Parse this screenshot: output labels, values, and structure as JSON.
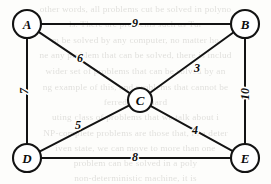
{
  "chart_data": {
    "type": "diagram",
    "diagram_kind": "weighted-undirected-graph",
    "title": "",
    "nodes": [
      {
        "id": "A",
        "label": "A",
        "x": 27,
        "y": 24,
        "r": 14
      },
      {
        "id": "B",
        "label": "B",
        "x": 245,
        "y": 24,
        "r": 14
      },
      {
        "id": "C",
        "label": "C",
        "x": 140,
        "y": 100,
        "r": 12
      },
      {
        "id": "D",
        "label": "D",
        "x": 27,
        "y": 158,
        "r": 14
      },
      {
        "id": "E",
        "label": "E",
        "x": 245,
        "y": 158,
        "r": 14
      }
    ],
    "edges": [
      {
        "from": "A",
        "to": "B",
        "weight": "9",
        "label_x": 135,
        "label_y": 23,
        "rotation": 0
      },
      {
        "from": "A",
        "to": "C",
        "weight": "6",
        "label_x": 80,
        "label_y": 58,
        "rotation": 0
      },
      {
        "from": "A",
        "to": "D",
        "weight": "7",
        "label_x": 24,
        "label_y": 91,
        "rotation": -90
      },
      {
        "from": "C",
        "to": "B",
        "weight": "3",
        "label_x": 197,
        "label_y": 68,
        "rotation": 0
      },
      {
        "from": "D",
        "to": "C",
        "weight": "5",
        "label_x": 78,
        "label_y": 125,
        "rotation": 0
      },
      {
        "from": "C",
        "to": "E",
        "weight": "4",
        "label_x": 195,
        "label_y": 130,
        "rotation": 0
      },
      {
        "from": "B",
        "to": "E",
        "weight": "10",
        "label_x": 245,
        "label_y": 94,
        "rotation": -90
      },
      {
        "from": "D",
        "to": "E",
        "weight": "8",
        "label_x": 135,
        "label_y": 157,
        "rotation": 0
      }
    ],
    "colors": {
      "stroke": "#131313",
      "node_fill": "#ffffff",
      "background": "#fdfdfb",
      "ghost_text": "#6d6a62"
    }
  },
  "background_bleed_text": {
    "note": "faint show-through text from the reverse side of the scanned page",
    "lines": [
      {
        "text": "other words, all problems cut be solved in polyno",
        "y": 2
      },
      {
        "text": "ls. There are problems such as Tur",
        "y": 17
      },
      {
        "text": "m be solved by any computer, no matter ho",
        "y": 33
      },
      {
        "text": "ne any problem that can be solved, there is includ",
        "y": 48
      },
      {
        "text": "wider set of problems that can be solved by an",
        "y": 64
      },
      {
        "text": "ng example of this, and problems that cannot be",
        "y": 80
      },
      {
        "text": "ferred to as hard",
        "y": 95
      },
      {
        "text": "uting class of problems that we talk about i",
        "y": 110
      },
      {
        "text": "NP-complete problems are those that, in a deter",
        "y": 126
      },
      {
        "text": "iven state, we can move to more than one",
        "y": 141
      },
      {
        "text": "problem can be solved in a poly",
        "y": 156
      },
      {
        "text": "non-deterministic machine, it is",
        "y": 171
      }
    ]
  }
}
